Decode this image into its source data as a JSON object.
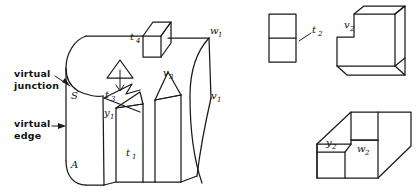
{
  "figure": {
    "title": "",
    "background_color": "#ffffff",
    "line_color": "#1a1a1a",
    "annotations": {
      "virtual_junction_line1": "virtual",
      "virtual_junction_line2": "junction",
      "virtual_edge_line1": "virtual",
      "virtual_edge_line2": "edge"
    },
    "main_object": {
      "name": "slotted-curved-block",
      "labels": [
        {
          "id": "label-S",
          "base": "S",
          "sub": ""
        },
        {
          "id": "label-A",
          "base": "A",
          "sub": ""
        },
        {
          "id": "label-t4",
          "base": "t",
          "sub": "4"
        },
        {
          "id": "label-t3",
          "base": "t",
          "sub": "3"
        },
        {
          "id": "label-t1",
          "base": "t",
          "sub": "1"
        },
        {
          "id": "label-y1",
          "base": "y",
          "sub": "1"
        },
        {
          "id": "label-v3",
          "base": "v",
          "sub": "3"
        },
        {
          "id": "label-w1",
          "base": "w",
          "sub": "1"
        },
        {
          "id": "label-v1",
          "base": "v",
          "sub": "1"
        }
      ]
    },
    "side_objects": [
      {
        "id": "object-t2",
        "name": "split-rectangle",
        "label": {
          "base": "t",
          "sub": "2"
        }
      },
      {
        "id": "object-v2",
        "name": "L-shaped-block",
        "label": {
          "base": "v",
          "sub": "2"
        }
      },
      {
        "id": "object-yw2",
        "name": "stepped-block",
        "labels": [
          {
            "base": "y",
            "sub": "2"
          },
          {
            "base": "w",
            "sub": "2"
          }
        ]
      }
    ]
  }
}
